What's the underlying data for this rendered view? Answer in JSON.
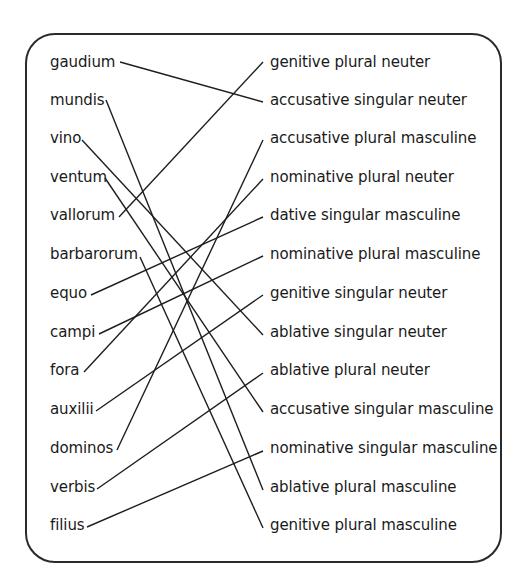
{
  "diagram": {
    "type": "matching-exercise",
    "left_items": [
      {
        "label": "gaudium",
        "y": 63
      },
      {
        "label": "mundis",
        "y": 101
      },
      {
        "label": "vino",
        "y": 139
      },
      {
        "label": "ventum",
        "y": 178
      },
      {
        "label": "vallorum",
        "y": 216
      },
      {
        "label": "barbarorum",
        "y": 255
      },
      {
        "label": "equo",
        "y": 294
      },
      {
        "label": "campi",
        "y": 333
      },
      {
        "label": "fora",
        "y": 371
      },
      {
        "label": "auxilii",
        "y": 410
      },
      {
        "label": "dominos",
        "y": 449
      },
      {
        "label": "verbis",
        "y": 488
      },
      {
        "label": "filius",
        "y": 526
      }
    ],
    "right_items": [
      {
        "label": "genitive plural neuter",
        "y": 63
      },
      {
        "label": "accusative singular neuter",
        "y": 101
      },
      {
        "label": "accusative plural masculine",
        "y": 139
      },
      {
        "label": "nominative plural neuter",
        "y": 178
      },
      {
        "label": "dative singular masculine",
        "y": 216
      },
      {
        "label": "nominative plural masculine",
        "y": 255
      },
      {
        "label": "genitive singular neuter",
        "y": 294
      },
      {
        "label": "ablative singular neuter",
        "y": 333
      },
      {
        "label": "ablative plural neuter",
        "y": 371
      },
      {
        "label": "accusative singular masculine",
        "y": 410
      },
      {
        "label": "nominative singular masculine",
        "y": 449
      },
      {
        "label": "ablative plural masculine",
        "y": 488
      },
      {
        "label": "genitive plural masculine",
        "y": 526
      }
    ],
    "connections": [
      {
        "from": "gaudium",
        "to": "accusative singular neuter",
        "x1": 120,
        "y1": 62,
        "x2": 263,
        "y2": 102
      },
      {
        "from": "mundis",
        "to": "ablative plural masculine",
        "x1": 106,
        "y1": 100,
        "x2": 263,
        "y2": 490
      },
      {
        "from": "vino",
        "to": "ablative singular neuter",
        "x1": 82,
        "y1": 140,
        "x2": 263,
        "y2": 335
      },
      {
        "from": "ventum",
        "to": "accusative singular masculine",
        "x1": 105,
        "y1": 178,
        "x2": 263,
        "y2": 412
      },
      {
        "from": "vallorum",
        "to": "genitive plural neuter",
        "x1": 119,
        "y1": 217,
        "x2": 263,
        "y2": 62
      },
      {
        "from": "barbarorum",
        "to": "genitive plural masculine",
        "x1": 140,
        "y1": 257,
        "x2": 263,
        "y2": 528
      },
      {
        "from": "equo",
        "to": "dative singular masculine",
        "x1": 91,
        "y1": 295,
        "x2": 263,
        "y2": 217
      },
      {
        "from": "campi",
        "to": "nominative plural masculine",
        "x1": 99,
        "y1": 334,
        "x2": 263,
        "y2": 256
      },
      {
        "from": "fora",
        "to": "nominative plural neuter",
        "x1": 84,
        "y1": 372,
        "x2": 263,
        "y2": 179
      },
      {
        "from": "auxilii",
        "to": "genitive singular neuter",
        "x1": 96,
        "y1": 411,
        "x2": 263,
        "y2": 295
      },
      {
        "from": "dominos",
        "to": "accusative plural masculine",
        "x1": 117,
        "y1": 450,
        "x2": 263,
        "y2": 140
      },
      {
        "from": "verbis",
        "to": "ablative plural neuter",
        "x1": 97,
        "y1": 489,
        "x2": 263,
        "y2": 373
      },
      {
        "from": "filius",
        "to": "nominative singular masculine",
        "x1": 87,
        "y1": 527,
        "x2": 263,
        "y2": 451
      }
    ],
    "colors": {
      "line": "#1e1e1e",
      "text": "#1a1a1a",
      "frame": "#2a2a2a",
      "background": "#ffffff"
    }
  }
}
